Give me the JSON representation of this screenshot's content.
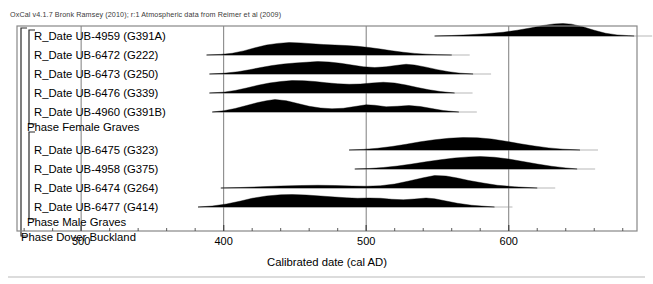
{
  "credit": "OxCal v4.1.7 Bronk Ramsey (2010); r:1 Atmospheric data from Reimer et al (2009)",
  "axis": {
    "title": "Calibrated date (cal AD)",
    "ticks": [
      "300",
      "400",
      "500",
      "600"
    ],
    "tick_values": [
      300,
      400,
      500,
      600
    ],
    "minor_step": 20,
    "range": [
      255,
      690
    ]
  },
  "groups": [
    {
      "name": "Phase Female Graves",
      "bracket": true
    },
    {
      "name": "Phase Male Graves",
      "bracket": true
    },
    {
      "name": "Phase Dover Buckland",
      "bracket": true
    }
  ],
  "rows": [
    {
      "label": "R_Date UB-4959 (G391A)",
      "type": "date"
    },
    {
      "label": "R_Date UB-6472 (G222)",
      "type": "date"
    },
    {
      "label": "R_Date UB-6473 (G250)",
      "type": "date"
    },
    {
      "label": "R_Date UB-6476 (G339)",
      "type": "date"
    },
    {
      "label": "R_Date UB-4960 (G391B)",
      "type": "date"
    },
    {
      "label": "Phase Female Graves",
      "type": "phase"
    },
    {
      "label": "R_Date UB-6475 (G323)",
      "type": "date"
    },
    {
      "label": "R_Date UB-4958 (G375)",
      "type": "date"
    },
    {
      "label": "R_Date UB-6474 (G264)",
      "type": "date"
    },
    {
      "label": "R_Date UB-6477 (G414)",
      "type": "date"
    },
    {
      "label": "Phase Male Graves",
      "type": "phase"
    },
    {
      "label": "Phase Dover Buckland",
      "type": "phase"
    }
  ],
  "chart_data": {
    "type": "area",
    "title": "",
    "xlabel": "Calibrated date (cal AD)",
    "ylabel": "",
    "xlim": [
      255,
      690
    ],
    "grid": true,
    "legend": "none",
    "series": [
      {
        "name": "R_Date UB-4959 (G391A)",
        "baseline_y": 36,
        "start": 548,
        "end": 688,
        "peak": 630,
        "points": [
          [
            548,
            0
          ],
          [
            560,
            0.04
          ],
          [
            572,
            0.1
          ],
          [
            584,
            0.18
          ],
          [
            596,
            0.3
          ],
          [
            606,
            0.46
          ],
          [
            616,
            0.66
          ],
          [
            624,
            0.84
          ],
          [
            632,
            0.97
          ],
          [
            638,
            1.0
          ],
          [
            644,
            0.95
          ],
          [
            652,
            0.74
          ],
          [
            660,
            0.46
          ],
          [
            668,
            0.22
          ],
          [
            676,
            0.09
          ],
          [
            684,
            0.03
          ],
          [
            688,
            0
          ]
        ]
      },
      {
        "name": "R_Date UB-6472 (G222)",
        "baseline_y": 55,
        "start": 388,
        "end": 560,
        "peak": 445,
        "points": [
          [
            388,
            0
          ],
          [
            398,
            0.05
          ],
          [
            406,
            0.14
          ],
          [
            414,
            0.33
          ],
          [
            422,
            0.58
          ],
          [
            430,
            0.8
          ],
          [
            438,
            0.93
          ],
          [
            446,
            1.0
          ],
          [
            454,
            0.97
          ],
          [
            462,
            0.9
          ],
          [
            470,
            0.84
          ],
          [
            478,
            0.8
          ],
          [
            486,
            0.76
          ],
          [
            494,
            0.7
          ],
          [
            502,
            0.6
          ],
          [
            510,
            0.48
          ],
          [
            518,
            0.34
          ],
          [
            526,
            0.22
          ],
          [
            534,
            0.13
          ],
          [
            542,
            0.07
          ],
          [
            550,
            0.03
          ],
          [
            560,
            0
          ]
        ]
      },
      {
        "name": "R_Date UB-6473 (G250)",
        "baseline_y": 74,
        "start": 390,
        "end": 575,
        "peak": 465,
        "points": [
          [
            390,
            0
          ],
          [
            400,
            0.06
          ],
          [
            410,
            0.18
          ],
          [
            418,
            0.34
          ],
          [
            426,
            0.52
          ],
          [
            434,
            0.68
          ],
          [
            442,
            0.8
          ],
          [
            450,
            0.88
          ],
          [
            458,
            0.94
          ],
          [
            466,
            1.0
          ],
          [
            474,
            0.96
          ],
          [
            482,
            0.86
          ],
          [
            490,
            0.72
          ],
          [
            498,
            0.58
          ],
          [
            506,
            0.52
          ],
          [
            514,
            0.58
          ],
          [
            522,
            0.7
          ],
          [
            528,
            0.78
          ],
          [
            534,
            0.72
          ],
          [
            542,
            0.55
          ],
          [
            550,
            0.35
          ],
          [
            558,
            0.18
          ],
          [
            566,
            0.07
          ],
          [
            575,
            0
          ]
        ]
      },
      {
        "name": "R_Date UB-6476 (G339)",
        "baseline_y": 93,
        "start": 390,
        "end": 562,
        "peak": 455,
        "points": [
          [
            390,
            0
          ],
          [
            400,
            0.07
          ],
          [
            408,
            0.2
          ],
          [
            416,
            0.4
          ],
          [
            424,
            0.62
          ],
          [
            432,
            0.8
          ],
          [
            440,
            0.92
          ],
          [
            448,
            1.0
          ],
          [
            456,
            0.99
          ],
          [
            464,
            0.92
          ],
          [
            472,
            0.82
          ],
          [
            480,
            0.74
          ],
          [
            488,
            0.7
          ],
          [
            496,
            0.72
          ],
          [
            504,
            0.8
          ],
          [
            512,
            0.86
          ],
          [
            520,
            0.8
          ],
          [
            528,
            0.64
          ],
          [
            536,
            0.44
          ],
          [
            544,
            0.26
          ],
          [
            552,
            0.12
          ],
          [
            562,
            0
          ]
        ]
      },
      {
        "name": "R_Date UB-4960 (G391B)",
        "baseline_y": 112,
        "start": 392,
        "end": 565,
        "peak": 430,
        "points": [
          [
            392,
            0
          ],
          [
            400,
            0.1
          ],
          [
            408,
            0.28
          ],
          [
            416,
            0.52
          ],
          [
            424,
            0.76
          ],
          [
            430,
            0.9
          ],
          [
            436,
            1.0
          ],
          [
            444,
            0.9
          ],
          [
            452,
            0.68
          ],
          [
            460,
            0.46
          ],
          [
            468,
            0.32
          ],
          [
            476,
            0.26
          ],
          [
            484,
            0.3
          ],
          [
            492,
            0.44
          ],
          [
            500,
            0.58
          ],
          [
            506,
            0.54
          ],
          [
            514,
            0.42
          ],
          [
            522,
            0.46
          ],
          [
            530,
            0.52
          ],
          [
            538,
            0.44
          ],
          [
            546,
            0.28
          ],
          [
            554,
            0.12
          ],
          [
            565,
            0
          ]
        ]
      },
      {
        "name": "R_Date UB-6475 (G323)",
        "baseline_y": 150,
        "start": 488,
        "end": 650,
        "peak": 570,
        "points": [
          [
            488,
            0
          ],
          [
            498,
            0.05
          ],
          [
            508,
            0.14
          ],
          [
            518,
            0.28
          ],
          [
            528,
            0.46
          ],
          [
            538,
            0.66
          ],
          [
            548,
            0.82
          ],
          [
            558,
            0.94
          ],
          [
            568,
            1.0
          ],
          [
            578,
            0.98
          ],
          [
            588,
            0.88
          ],
          [
            598,
            0.7
          ],
          [
            608,
            0.5
          ],
          [
            618,
            0.32
          ],
          [
            628,
            0.17
          ],
          [
            638,
            0.07
          ],
          [
            650,
            0
          ]
        ]
      },
      {
        "name": "R_Date UB-4958 (G375)",
        "baseline_y": 169,
        "start": 492,
        "end": 648,
        "peak": 578,
        "points": [
          [
            492,
            0
          ],
          [
            502,
            0.04
          ],
          [
            512,
            0.12
          ],
          [
            522,
            0.24
          ],
          [
            532,
            0.4
          ],
          [
            542,
            0.58
          ],
          [
            552,
            0.74
          ],
          [
            562,
            0.88
          ],
          [
            572,
            0.97
          ],
          [
            580,
            1.0
          ],
          [
            590,
            0.94
          ],
          [
            600,
            0.8
          ],
          [
            610,
            0.6
          ],
          [
            620,
            0.4
          ],
          [
            630,
            0.22
          ],
          [
            640,
            0.09
          ],
          [
            648,
            0
          ]
        ]
      },
      {
        "name": "R_Date UB-6474 (G264)",
        "baseline_y": 188,
        "start": 398,
        "end": 620,
        "peak": 548,
        "points": [
          [
            398,
            0
          ],
          [
            412,
            0.04
          ],
          [
            426,
            0.1
          ],
          [
            440,
            0.16
          ],
          [
            454,
            0.2
          ],
          [
            466,
            0.22
          ],
          [
            478,
            0.2
          ],
          [
            490,
            0.16
          ],
          [
            500,
            0.14
          ],
          [
            510,
            0.18
          ],
          [
            520,
            0.32
          ],
          [
            530,
            0.56
          ],
          [
            540,
            0.82
          ],
          [
            548,
            1.0
          ],
          [
            556,
            0.96
          ],
          [
            564,
            0.8
          ],
          [
            572,
            0.6
          ],
          [
            582,
            0.4
          ],
          [
            592,
            0.22
          ],
          [
            604,
            0.1
          ],
          [
            620,
            0
          ]
        ]
      },
      {
        "name": "R_Date UB-6477 (G414)",
        "baseline_y": 207,
        "start": 382,
        "end": 590,
        "peak": 448,
        "points": [
          [
            382,
            0
          ],
          [
            392,
            0.08
          ],
          [
            402,
            0.24
          ],
          [
            412,
            0.48
          ],
          [
            420,
            0.7
          ],
          [
            430,
            0.88
          ],
          [
            440,
            0.98
          ],
          [
            448,
            1.0
          ],
          [
            458,
            0.96
          ],
          [
            468,
            0.88
          ],
          [
            478,
            0.8
          ],
          [
            486,
            0.74
          ],
          [
            494,
            0.7
          ],
          [
            502,
            0.72
          ],
          [
            510,
            0.7
          ],
          [
            518,
            0.62
          ],
          [
            526,
            0.58
          ],
          [
            534,
            0.64
          ],
          [
            542,
            0.72
          ],
          [
            548,
            0.66
          ],
          [
            556,
            0.48
          ],
          [
            564,
            0.3
          ],
          [
            574,
            0.14
          ],
          [
            590,
            0
          ]
        ]
      }
    ]
  }
}
